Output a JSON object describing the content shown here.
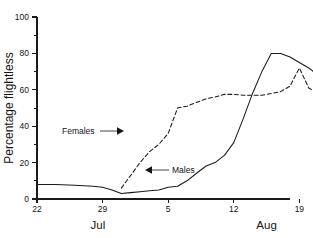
{
  "chart_data": {
    "type": "line",
    "title": "",
    "xlabel": "",
    "ylabel": "Percentage flightless",
    "ylim": [
      0,
      100
    ],
    "xlim": [
      22,
      49
    ],
    "grid": false,
    "legend": "inline annotations with arrows",
    "y_ticks": [
      0,
      20,
      40,
      60,
      80,
      100
    ],
    "y_tick_labels": [
      "0",
      "20",
      "40",
      "60",
      "80",
      "100"
    ],
    "y_minor_ticks": [
      10,
      30,
      50,
      70,
      90
    ],
    "x_ticks": [
      22,
      29,
      36,
      43,
      50,
      58
    ],
    "x_tick_labels": [
      "22",
      "29",
      "5",
      "12",
      "19",
      "27"
    ],
    "month_labels": [
      {
        "text": "Jul",
        "x": 28.5
      },
      {
        "text": "Aug",
        "x": 46.5
      }
    ],
    "series": [
      {
        "name": "Males",
        "style": "solid",
        "color": "#1a1a1a",
        "annotation": {
          "label": "Males",
          "arrow": "left"
        },
        "x": [
          22,
          24,
          26,
          28,
          29,
          30,
          31,
          32,
          33,
          34,
          35,
          36,
          37,
          38,
          39,
          40,
          41,
          42,
          43,
          44,
          45,
          46,
          47,
          48,
          49,
          50,
          51,
          52,
          53,
          54,
          55,
          56,
          57,
          58
        ],
        "values": [
          8,
          8,
          7.5,
          7,
          6.5,
          5,
          3,
          3.5,
          4,
          4.5,
          5,
          6.5,
          7,
          10,
          14,
          18,
          20,
          24,
          31,
          44,
          58,
          70,
          80,
          80,
          78,
          75,
          72,
          68,
          63,
          58,
          53,
          50,
          33,
          9
        ]
      },
      {
        "name": "Females",
        "style": "dashed",
        "color": "#1a1a1a",
        "annotation": {
          "label": "Females",
          "arrow": "right"
        },
        "x": [
          31,
          32,
          33,
          34,
          35,
          36,
          37,
          38,
          39,
          40,
          41,
          42,
          43,
          44,
          45,
          46,
          47,
          48,
          49,
          50,
          51,
          52,
          53,
          54,
          55,
          56,
          57,
          58
        ],
        "values": [
          6,
          13,
          20,
          26,
          30,
          36,
          50,
          51,
          53,
          55,
          56,
          57.5,
          57.5,
          57,
          57,
          57,
          58,
          59,
          62,
          72,
          61,
          58,
          58,
          59,
          59.5,
          60,
          61.5,
          64
        ]
      }
    ],
    "annotations": [
      {
        "label": "Females",
        "arrow_direction": "right",
        "text_x": 62,
        "text_y": 131
      },
      {
        "label": "Males",
        "arrow_direction": "left",
        "text_x": 172,
        "text_y": 170
      }
    ]
  }
}
